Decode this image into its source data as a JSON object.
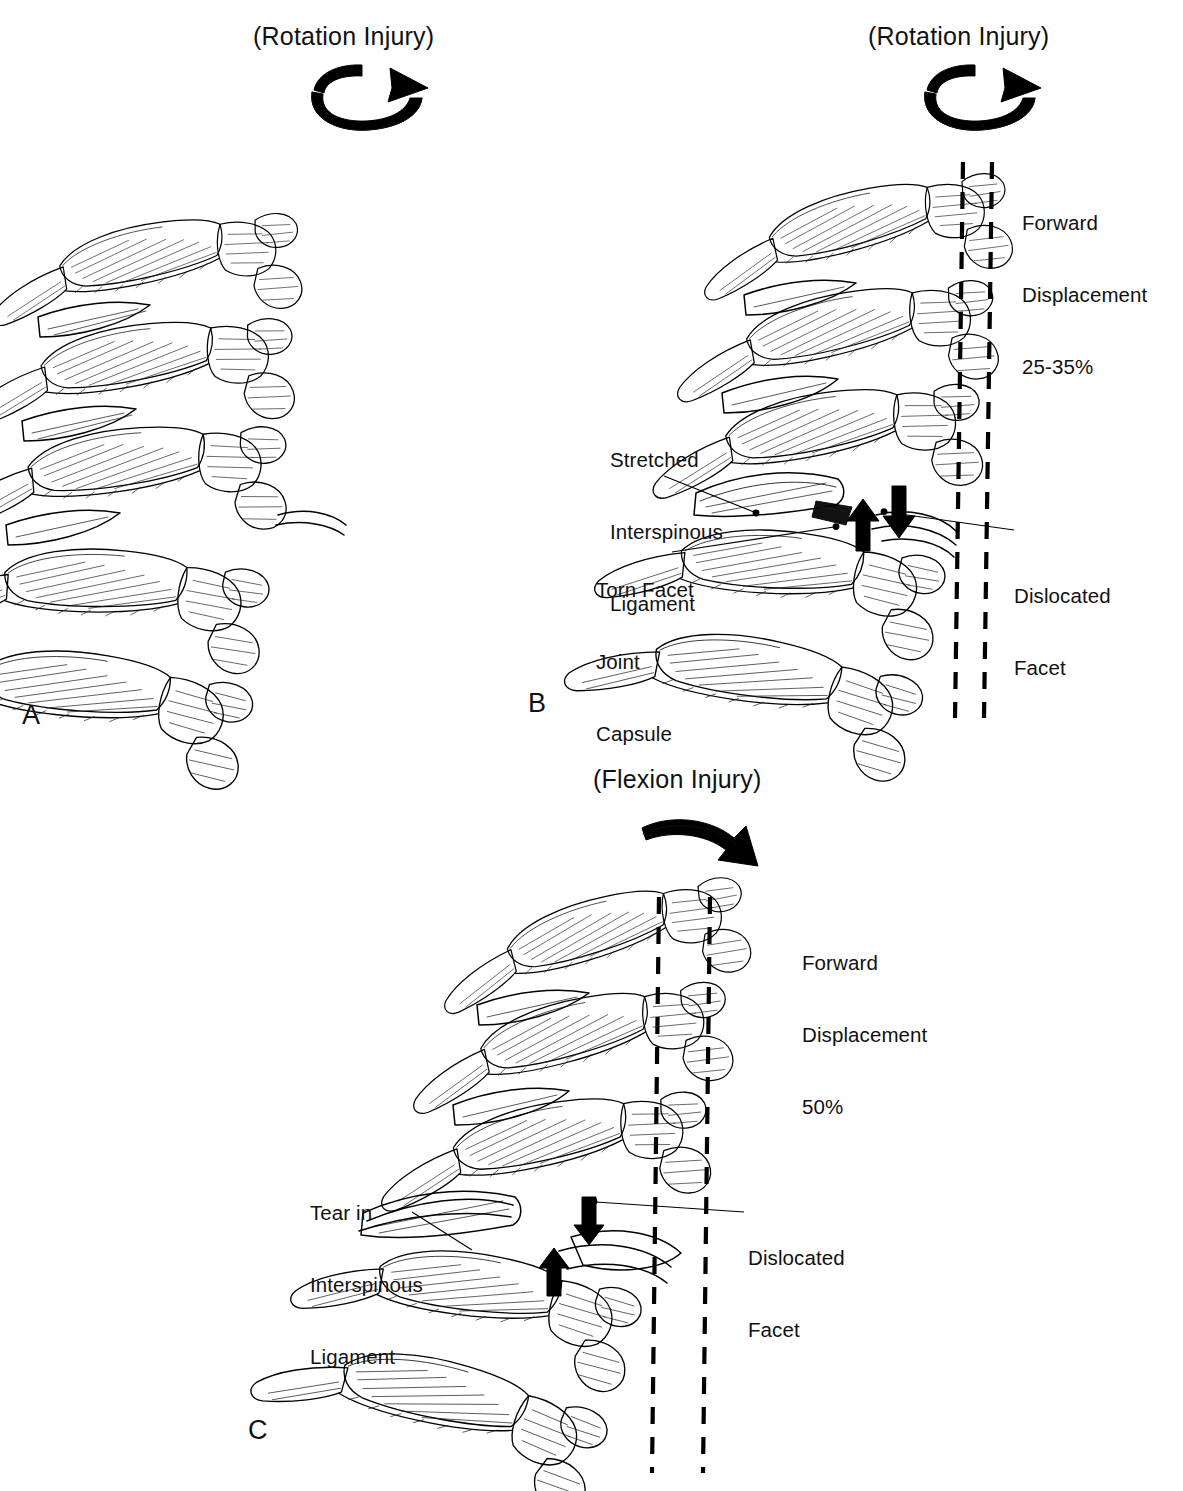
{
  "figure": {
    "kind": "medical-illustration",
    "background_color": "#ffffff",
    "ink_color": "#000000"
  },
  "panels": [
    {
      "id": "A",
      "letter": "A",
      "title": "(Rotation Injury)",
      "arrow_icon": "rotation-arrow-icon",
      "labels": [],
      "dashed_lines": 0
    },
    {
      "id": "B",
      "letter": "B",
      "title": "(Rotation Injury)",
      "arrow_icon": "rotation-arrow-icon",
      "labels": [
        {
          "id": "stretched-interspinous-ligament",
          "lines": [
            "Stretched",
            "Interspinous",
            "Ligament"
          ]
        },
        {
          "id": "torn-facet-joint-capsule",
          "lines": [
            "Torn Facet",
            "Joint",
            "Capsule"
          ]
        },
        {
          "id": "dislocated-facet",
          "lines": [
            "Dislocated",
            "Facet"
          ]
        },
        {
          "id": "forward-displacement",
          "lines": [
            "Forward",
            "Displacement",
            "25-35%"
          ]
        }
      ],
      "displacement": "25-35%",
      "dashed_lines": 2,
      "block_arrows": [
        "up-arrow-icon",
        "down-arrow-icon"
      ]
    },
    {
      "id": "C",
      "letter": "C",
      "title": "(Flexion Injury)",
      "arrow_icon": "flexion-arrow-icon",
      "labels": [
        {
          "id": "tear-in-interspinous-ligament",
          "lines": [
            "Tear in",
            "Interspinous",
            "Ligament"
          ]
        },
        {
          "id": "dislocated-facet",
          "lines": [
            "Dislocated",
            "Facet"
          ]
        },
        {
          "id": "forward-displacement",
          "lines": [
            "Forward",
            "Displacement",
            "50%"
          ]
        }
      ],
      "displacement": "50%",
      "dashed_lines": 2,
      "block_arrows": [
        "up-arrow-icon",
        "down-arrow-icon"
      ]
    }
  ],
  "text": {
    "rotation_injury": "(Rotation Injury)",
    "flexion_injury": "(Flexion Injury)",
    "letter_a": "A",
    "letter_b": "B",
    "letter_c": "C",
    "b_stretched_1": "Stretched",
    "b_stretched_2": "Interspinous",
    "b_stretched_3": "Ligament",
    "b_torn_1": "Torn Facet",
    "b_torn_2": "Joint",
    "b_torn_3": "Capsule",
    "b_disl_1": "Dislocated",
    "b_disl_2": "Facet",
    "b_fwd_1": "Forward",
    "b_fwd_2": "Displacement",
    "b_fwd_3": "25-35%",
    "c_tear_1": "Tear in",
    "c_tear_2": "Interspinous",
    "c_tear_3": "Ligament",
    "c_disl_1": "Dislocated",
    "c_disl_2": "Facet",
    "c_fwd_1": "Forward",
    "c_fwd_2": "Displacement",
    "c_fwd_3": "50%"
  }
}
